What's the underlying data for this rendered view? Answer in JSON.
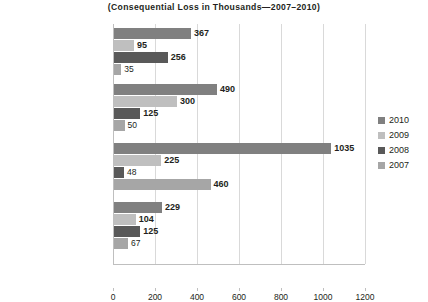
{
  "title": {
    "line1": "",
    "line2": "(Consequential Loss in Thousands—2007–2010)"
  },
  "chart_data": {
    "type": "bar",
    "orientation": "horizontal",
    "title": "(Consequential Loss in Thousands—2007–2010)",
    "xlabel": "",
    "ylabel": "",
    "xlim": [
      0,
      1200
    ],
    "xticks": [
      0,
      200,
      400,
      600,
      800,
      1000,
      1200
    ],
    "grid": true,
    "legend_position": "right",
    "categories": [
      "Data Compromise",
      "Regulatory Infraction",
      "Process Recovery Above Target",
      "Accidents"
    ],
    "series": [
      {
        "name": "2010",
        "color": "#808080",
        "values": [
          367,
          490,
          1035,
          229
        ]
      },
      {
        "name": "2009",
        "color": "#bfbfbf",
        "values": [
          95,
          300,
          225,
          104
        ]
      },
      {
        "name": "2008",
        "color": "#595959",
        "values": [
          256,
          125,
          48,
          125
        ]
      },
      {
        "name": "2007",
        "color": "#a6a6a6",
        "values": [
          35,
          50,
          460,
          67
        ]
      }
    ],
    "data_labels": [
      [
        "367",
        "95",
        "256",
        "35"
      ],
      [
        "490",
        "300",
        "125",
        "50"
      ],
      [
        "1035",
        "225",
        "48",
        "460"
      ],
      [
        "229",
        "104",
        "125",
        "67"
      ]
    ]
  },
  "axis": {
    "tick_labels": [
      "0",
      "200",
      "400",
      "600",
      "800",
      "1000",
      "1200"
    ]
  },
  "legend": {
    "items": [
      {
        "label": "2010",
        "color": "#808080"
      },
      {
        "label": "2009",
        "color": "#bfbfbf"
      },
      {
        "label": "2008",
        "color": "#595959"
      },
      {
        "label": "2007",
        "color": "#a6a6a6"
      }
    ]
  }
}
